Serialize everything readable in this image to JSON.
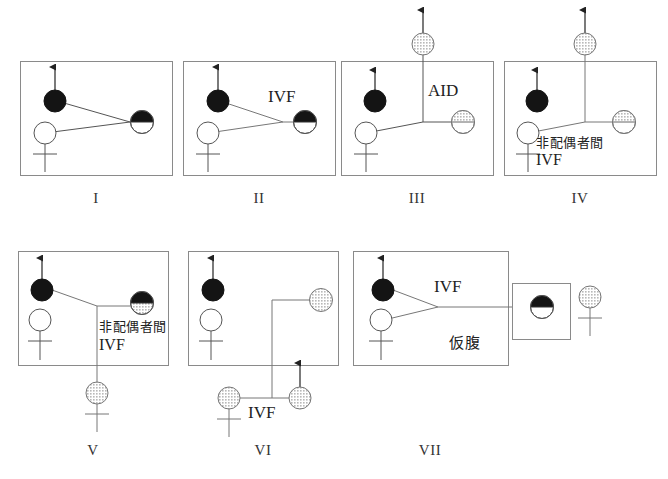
{
  "figure": {
    "title": "",
    "caption": "",
    "background": "#ffffff",
    "stroke": "#555555",
    "fill_male_affected": "#1a1a1a",
    "fill_female_open": "#ffffff",
    "fill_gray": "#cccccc",
    "legend_note": ""
  },
  "panels": [
    {
      "id": "I",
      "label": "I",
      "annotations": [],
      "symbols": [
        {
          "name": "affected-male-parent",
          "shape": "circle-filled-black",
          "arrow": "up"
        },
        {
          "name": "female-parent",
          "shape": "circle-open",
          "cross": "below"
        },
        {
          "name": "offspring-half-black-top",
          "shape": "circle-half-black-top-white-bottom"
        }
      ]
    },
    {
      "id": "II",
      "label": "II",
      "annotations": [
        {
          "name": "ivf-label",
          "text": "IVF"
        }
      ],
      "symbols": [
        {
          "name": "affected-male-parent",
          "shape": "circle-filled-black",
          "arrow": "up"
        },
        {
          "name": "female-parent",
          "shape": "circle-open",
          "cross": "below"
        },
        {
          "name": "offspring-half-black-top",
          "shape": "circle-half-black-top-white-bottom"
        }
      ]
    },
    {
      "id": "III",
      "label": "III",
      "annotations": [
        {
          "name": "aid-label",
          "text": "AID"
        }
      ],
      "symbols": [
        {
          "name": "affected-male-parent",
          "shape": "circle-filled-black",
          "arrow": "up"
        },
        {
          "name": "female-parent",
          "shape": "circle-open",
          "cross": "below"
        },
        {
          "name": "donor-above",
          "shape": "circle-gray",
          "arrow": "up"
        },
        {
          "name": "offspring-gray-top-divided",
          "shape": "circle-gray-top-white-bottom-divided"
        }
      ]
    },
    {
      "id": "IV",
      "label": "IV",
      "annotations": [
        {
          "name": "donor-ivf-label-jp",
          "text": "非配偶者間"
        },
        {
          "name": "donor-ivf-label-en",
          "text": "IVF"
        }
      ],
      "symbols": [
        {
          "name": "affected-male-parent",
          "shape": "circle-filled-black",
          "arrow": "up"
        },
        {
          "name": "female-parent",
          "shape": "circle-open",
          "cross": "below"
        },
        {
          "name": "donor-above",
          "shape": "circle-gray",
          "arrow": "up"
        },
        {
          "name": "offspring-gray-top-divided",
          "shape": "circle-gray-top-white-bottom-divided"
        }
      ]
    },
    {
      "id": "V",
      "label": "V",
      "annotations": [
        {
          "name": "donor-ivf-label-jp",
          "text": "非配偶者間"
        },
        {
          "name": "donor-ivf-label-en",
          "text": "IVF"
        }
      ],
      "symbols": [
        {
          "name": "affected-male-parent",
          "shape": "circle-filled-black",
          "arrow": "up"
        },
        {
          "name": "female-parent",
          "shape": "circle-open",
          "cross": "below"
        },
        {
          "name": "offspring-black-top-gray-bottom",
          "shape": "circle-black-top-gray-bottom"
        },
        {
          "name": "descendant-gray",
          "shape": "circle-gray",
          "cross": "below"
        }
      ]
    },
    {
      "id": "VI",
      "label": "VI",
      "annotations": [
        {
          "name": "ivf-label",
          "text": "IVF"
        }
      ],
      "symbols": [
        {
          "name": "affected-male-parent",
          "shape": "circle-filled-black",
          "arrow": "up"
        },
        {
          "name": "female-parent",
          "shape": "circle-open",
          "cross": "below"
        },
        {
          "name": "partner-gray",
          "shape": "circle-gray"
        },
        {
          "name": "donor-female-gray",
          "shape": "circle-gray",
          "cross": "below"
        },
        {
          "name": "donor-male-gray",
          "shape": "circle-gray",
          "arrow": "up"
        }
      ]
    },
    {
      "id": "VII",
      "label": "VII",
      "annotations": [
        {
          "name": "ivf-label",
          "text": "IVF"
        },
        {
          "name": "surrogate-label-jp",
          "text": "仮腹"
        }
      ],
      "symbols": [
        {
          "name": "affected-male-parent",
          "shape": "circle-filled-black",
          "arrow": "up"
        },
        {
          "name": "female-parent",
          "shape": "circle-open",
          "cross": "below"
        },
        {
          "name": "embryo-in-surrogate-box",
          "shape": "circle-half-black-top-white-bottom"
        },
        {
          "name": "surrogate-mother-gray",
          "shape": "circle-gray",
          "cross": "below"
        }
      ]
    }
  ]
}
